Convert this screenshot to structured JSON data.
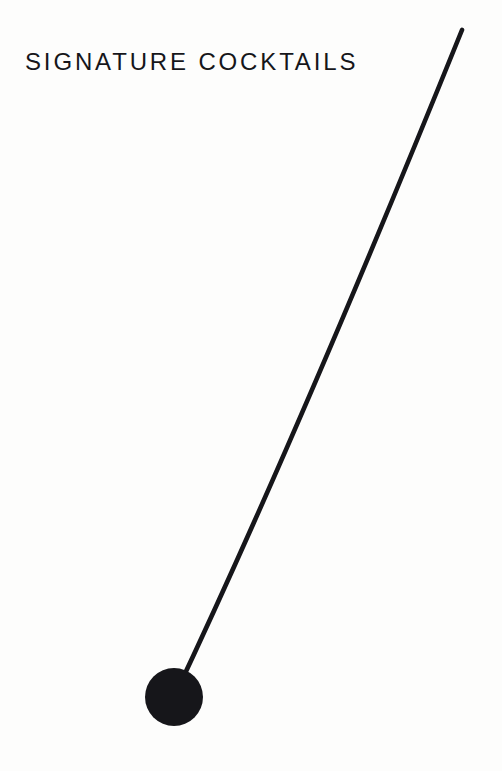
{
  "page": {
    "width": 502,
    "height": 771,
    "background_color": "#fdfdfc",
    "ink_color": "#16161a"
  },
  "header": {
    "title": "SIGNATURE COCKTAILS"
  },
  "decoration": {
    "name": "cocktail-stirrer",
    "description": "Long slender stirrer stick with a round ball end",
    "color": "#16161a",
    "stroke": {
      "width": 4.6,
      "tip": {
        "x": 462,
        "y": 30
      },
      "control": {
        "x": 300,
        "y": 430
      },
      "end": {
        "x": 174,
        "y": 697
      }
    },
    "ball": {
      "center_x": 174,
      "center_y": 697,
      "radius": 29
    }
  }
}
